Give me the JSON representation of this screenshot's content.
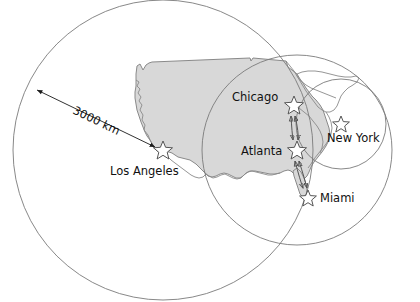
{
  "figure": {
    "name": "us-distance-range-map",
    "background_color": "#ffffff",
    "land_fill_color": "#d8d8d8",
    "outline_color": "#8a8a8a",
    "circle_stroke_color": "#7a7a7a",
    "star_fill_color": "#ffffff",
    "arrow_color": "#1a1a1a",
    "label_color": "#111111"
  },
  "scale": {
    "label": "3000 km",
    "rotation_deg": 35,
    "label_x": 72,
    "label_y": 113,
    "arrow_from_x": 37,
    "arrow_from_y": 90,
    "arrow_to_x": 155,
    "arrow_to_y": 147
  },
  "cities": [
    {
      "name": "Los Angeles",
      "label": "Los Angeles",
      "star_x": 163,
      "star_y": 150,
      "star_r": 9,
      "label_x": 110,
      "label_y": 175,
      "label_anchor": "start"
    },
    {
      "name": "Chicago",
      "label": "Chicago",
      "star_x": 294,
      "star_y": 105,
      "star_r": 9,
      "label_x": 232,
      "label_y": 101,
      "label_anchor": "start"
    },
    {
      "name": "New York",
      "label": "New York",
      "star_x": 341,
      "star_y": 124,
      "star_r": 8,
      "label_x": 327,
      "label_y": 142,
      "label_anchor": "start"
    },
    {
      "name": "Atlanta",
      "label": "Atlanta",
      "star_x": 297,
      "star_y": 150,
      "star_r": 9,
      "label_x": 241,
      "label_y": 155,
      "label_anchor": "start"
    },
    {
      "name": "Miami",
      "label": "Miami",
      "star_x": 308,
      "star_y": 198,
      "star_r": 8,
      "label_x": 320,
      "label_y": 202,
      "label_anchor": "start"
    }
  ],
  "range_circles": [
    {
      "name": "los-angeles-range-circle",
      "center_city": "Los Angeles",
      "cx": 163,
      "cy": 150,
      "r": 150
    },
    {
      "name": "atlanta-range-circle",
      "center_city": "Atlanta",
      "cx": 297,
      "cy": 150,
      "r": 95
    },
    {
      "name": "new-york-range-circle",
      "center_city": "New York",
      "cx": 341,
      "cy": 124,
      "r": 45
    }
  ],
  "connections": [
    {
      "name": "chicago-atlanta-link",
      "from": "Chicago",
      "to": "Atlanta",
      "double_headed": true
    },
    {
      "name": "atlanta-miami-link",
      "from": "Atlanta",
      "to": "Miami",
      "double_headed": true
    }
  ],
  "geography": {
    "country_label": "United States",
    "northeast_region_label": "Northeast region outline"
  }
}
